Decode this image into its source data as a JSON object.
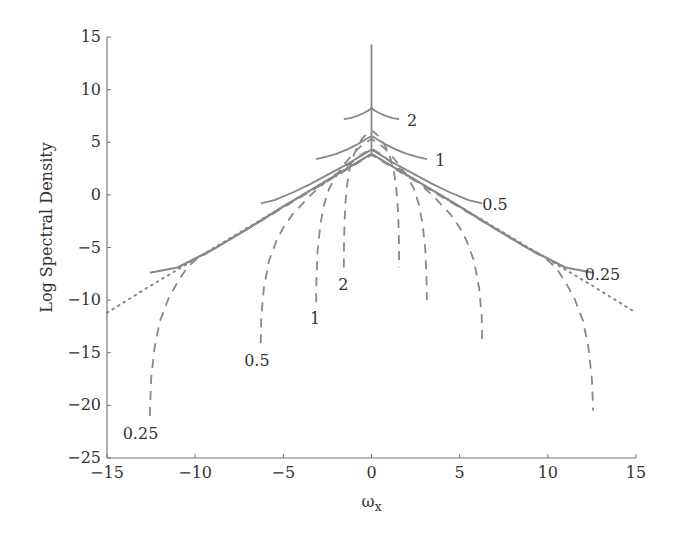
{
  "chart_data": {
    "type": "line",
    "title": "",
    "xlabel": "ω",
    "xlabel_sub": "x",
    "ylabel": "Log Spectral Density",
    "xlim": [
      -15,
      15
    ],
    "ylim": [
      -25,
      15
    ],
    "xticks": [
      -15,
      -10,
      -5,
      0,
      5,
      10,
      15
    ],
    "yticks": [
      -25,
      -20,
      -15,
      -10,
      -5,
      0,
      5,
      10,
      15
    ],
    "xtick_labels": [
      "−15",
      "−10",
      "−5",
      "0",
      "5",
      "10",
      "15"
    ],
    "ytick_labels": [
      "−25",
      "−20",
      "−15",
      "−10",
      "−5",
      "0",
      "5",
      "10",
      "15"
    ],
    "grid": false,
    "legend": "none",
    "colors": {
      "lines": "#888888",
      "axes": "#777777",
      "text": "#333333"
    },
    "series": [
      {
        "name": "true spectrum",
        "style": "dotted",
        "x": [
          -15,
          -12.5,
          -10,
          -7.5,
          -5,
          -2.5,
          0,
          2.5,
          5,
          7.5,
          10,
          12.5,
          15
        ],
        "y": [
          -11.2,
          -8.6,
          -6.1,
          -3.6,
          -1.1,
          1.4,
          3.9,
          1.4,
          -1.1,
          -3.6,
          -6.1,
          -8.6,
          -11.2
        ]
      },
      {
        "name": "aliased 0.25",
        "style": "solid",
        "label": "0.25",
        "x": [
          -12.57,
          -11,
          -9,
          -7,
          -5,
          -3,
          -1,
          0,
          1,
          3,
          5,
          7,
          9,
          11,
          12.57
        ],
        "y": [
          -7.4,
          -6.9,
          -5.2,
          -3.2,
          -1.1,
          0.9,
          2.9,
          3.9,
          2.9,
          0.9,
          -1.1,
          -3.2,
          -5.2,
          -6.9,
          -7.4
        ]
      },
      {
        "name": "aliased 0.5",
        "style": "solid",
        "label": "0.5",
        "x": [
          -6.28,
          -5.5,
          -4.5,
          -3.5,
          -2.5,
          -1.5,
          -0.5,
          0,
          0.5,
          1.5,
          2.5,
          3.5,
          4.5,
          5.5,
          6.28
        ],
        "y": [
          -0.8,
          -0.5,
          0.2,
          1.0,
          1.9,
          2.8,
          3.8,
          4.3,
          3.8,
          2.8,
          1.9,
          1.0,
          0.2,
          -0.5,
          -0.8
        ]
      },
      {
        "name": "aliased 1",
        "style": "solid",
        "label": "1",
        "x": [
          -3.14,
          -2.6,
          -2.0,
          -1.4,
          -0.8,
          -0.3,
          0,
          0.3,
          0.8,
          1.4,
          2.0,
          2.6,
          3.14
        ],
        "y": [
          3.4,
          3.6,
          3.9,
          4.3,
          4.8,
          5.3,
          5.6,
          5.3,
          4.8,
          4.3,
          3.9,
          3.6,
          3.4
        ]
      },
      {
        "name": "aliased 2",
        "style": "solid",
        "label": "2",
        "x": [
          -1.57,
          -1.2,
          -0.8,
          -0.4,
          -0.1,
          0,
          0.1,
          0.4,
          0.8,
          1.2,
          1.57
        ],
        "y": [
          7.2,
          7.3,
          7.5,
          7.8,
          8.1,
          8.3,
          8.1,
          7.8,
          7.5,
          7.3,
          7.2
        ]
      },
      {
        "name": "spike",
        "style": "solid",
        "x": [
          0,
          0
        ],
        "y": [
          3.9,
          14.3
        ]
      },
      {
        "name": "filtered 0.25",
        "style": "dashed",
        "label": "0.25",
        "x": [
          -12.57,
          -12.5,
          -12.3,
          -12.0,
          -11.5,
          -11.0,
          -10.5,
          -10,
          -7.5,
          -5,
          -2.5,
          0,
          2.5,
          5,
          7.5,
          10,
          10.5,
          11.0,
          11.5,
          12.0,
          12.3,
          12.5,
          12.57
        ],
        "y": [
          -21.0,
          -17.5,
          -14.5,
          -12.0,
          -9.8,
          -8.3,
          -7.0,
          -6.2,
          -3.7,
          -1.2,
          1.3,
          3.8,
          1.3,
          -1.2,
          -3.7,
          -6.2,
          -7.0,
          -8.3,
          -9.8,
          -12.0,
          -14.5,
          -17.5,
          -20.5
        ]
      },
      {
        "name": "filtered 0.5",
        "style": "dashed",
        "label": "0.5",
        "x": [
          -6.28,
          -6.25,
          -6.1,
          -5.8,
          -5.4,
          -5.0,
          -4.5,
          -3.5,
          -2.5,
          -1.5,
          -0.5,
          0,
          0.5,
          1.5,
          2.5,
          3.5,
          4.5,
          5.0,
          5.4,
          5.8,
          6.1,
          6.25,
          6.28
        ],
        "y": [
          -14.1,
          -11.5,
          -8.8,
          -6.2,
          -4.4,
          -3.1,
          -1.9,
          -0.1,
          1.4,
          2.6,
          3.9,
          4.4,
          3.9,
          2.6,
          1.4,
          -0.1,
          -1.9,
          -3.1,
          -4.4,
          -6.2,
          -8.8,
          -11.5,
          -14.0
        ]
      },
      {
        "name": "filtered 1",
        "style": "dashed",
        "label": "1",
        "x": [
          -3.14,
          -3.12,
          -3.05,
          -2.9,
          -2.7,
          -2.4,
          -2.0,
          -1.5,
          -1.0,
          -0.5,
          0,
          0.5,
          1.0,
          1.5,
          2.0,
          2.4,
          2.7,
          2.9,
          3.05,
          3.12,
          3.14
        ],
        "y": [
          -10.2,
          -7.8,
          -5.2,
          -2.8,
          -1.0,
          0.6,
          1.8,
          3.0,
          4.0,
          4.8,
          5.3,
          4.8,
          4.0,
          3.0,
          1.8,
          0.6,
          -1.0,
          -2.8,
          -5.2,
          -7.8,
          -10.0
        ]
      },
      {
        "name": "filtered 2",
        "style": "dashed",
        "label": "2",
        "x": [
          -1.57,
          -1.56,
          -1.53,
          -1.47,
          -1.38,
          -1.25,
          -1.05,
          -0.8,
          -0.5,
          -0.2,
          0,
          0.2,
          0.5,
          0.8,
          1.05,
          1.25,
          1.38,
          1.47,
          1.53,
          1.56,
          1.57
        ],
        "y": [
          -6.9,
          -4.8,
          -2.6,
          -0.6,
          1.0,
          2.4,
          3.6,
          4.6,
          5.4,
          5.9,
          6.1,
          5.9,
          5.4,
          4.6,
          3.6,
          2.4,
          1.0,
          -0.6,
          -2.6,
          -4.8,
          -6.9
        ]
      }
    ],
    "annotations": [
      {
        "text": "2",
        "x": 2.3,
        "y": 7.0
      },
      {
        "text": "1",
        "x": 3.9,
        "y": 3.2
      },
      {
        "text": "0.5",
        "x": 7.0,
        "y": -1.0
      },
      {
        "text": "0.25",
        "x": 13.1,
        "y": -7.6
      },
      {
        "text": "2",
        "x": -1.6,
        "y": -8.6
      },
      {
        "text": "1",
        "x": -3.2,
        "y": -11.8
      },
      {
        "text": "0.5",
        "x": -6.5,
        "y": -15.8
      },
      {
        "text": "0.25",
        "x": -13.1,
        "y": -22.7
      }
    ]
  }
}
